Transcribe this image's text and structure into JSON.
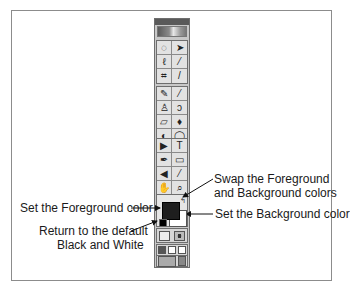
{
  "toolbox": {
    "groups": [
      {
        "rows": [
          [
            "marquee",
            "move"
          ],
          [
            "lasso",
            "magic-wand"
          ],
          [
            "crop",
            "slice"
          ]
        ]
      },
      {
        "rows": [
          [
            "healing-brush",
            "brush"
          ],
          [
            "clone-stamp",
            "history-brush"
          ],
          [
            "eraser",
            "paint-bucket"
          ],
          [
            "blur",
            "dodge"
          ]
        ]
      },
      {
        "rows": [
          [
            "path-select",
            "type"
          ],
          [
            "pen",
            "rectangle"
          ],
          [
            "notes",
            "eyedropper"
          ],
          [
            "hand",
            "zoom"
          ]
        ]
      }
    ],
    "glyphs": {
      "marquee": "◌",
      "move": "➤",
      "lasso": "ℓ",
      "magic-wand": "⁄",
      "crop": "⌗",
      "slice": "/",
      "healing-brush": "✎",
      "brush": "⁄",
      "clone-stamp": "♙",
      "history-brush": "ↄ",
      "eraser": "▱",
      "paint-bucket": "♦",
      "blur": "◐",
      "dodge": "◯",
      "path-select": "▶",
      "type": "T",
      "pen": "✒",
      "rectangle": "▭",
      "notes": "◀",
      "eyedropper": "⁄",
      "hand": "✋",
      "zoom": "⌕"
    },
    "colors": {
      "foreground": "#1e1e1e",
      "background": "#ffffff"
    },
    "swap_glyph": "↰"
  },
  "annotations": {
    "swap": [
      "Swap the Foreground",
      "and Background colors"
    ],
    "foreground": "Set the Foreground color",
    "background": "Set the Background color",
    "default": [
      "Return to the default",
      "Black and White"
    ]
  }
}
